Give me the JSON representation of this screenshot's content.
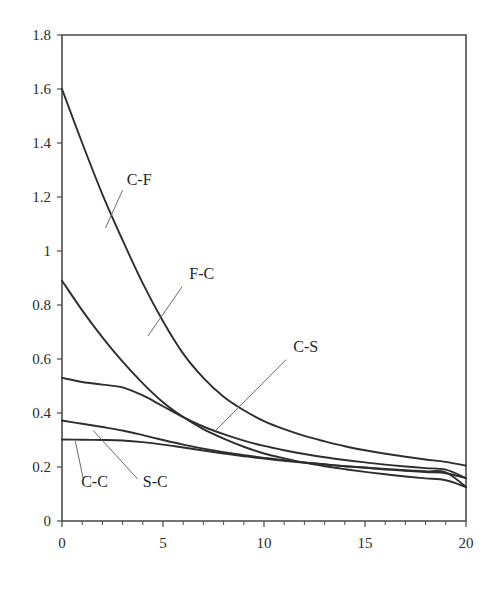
{
  "chart_data": {
    "type": "line",
    "title": "",
    "subtitle": "",
    "xlabel": "",
    "ylabel": "",
    "xlim": [
      0,
      20
    ],
    "ylim": [
      0,
      1.8
    ],
    "grid": false,
    "legend_position": "inline-annotations",
    "x_ticks": [
      0,
      5,
      10,
      15,
      20
    ],
    "x_tick_labels": [
      "0",
      "5",
      "10",
      "15",
      "20"
    ],
    "x_minor_tick_step": 1,
    "y_ticks": [
      0,
      0.2,
      0.4,
      0.6,
      0.8,
      1,
      1.2,
      1.4,
      1.6,
      1.8
    ],
    "y_tick_labels": [
      "0",
      "0.2",
      "0.4",
      "0.6",
      "0.8",
      "1",
      "1.2",
      "1.4",
      "1.6",
      "1.8"
    ],
    "x": [
      0,
      1,
      2,
      3,
      4,
      5,
      6,
      7,
      8,
      9,
      10,
      11,
      12,
      13,
      14,
      15,
      16,
      17,
      18,
      19,
      20
    ],
    "series": [
      {
        "name": "C-F",
        "label": "C-F",
        "color": "#2e2e2e",
        "values": [
          1.6,
          1.4,
          1.21,
          1.04,
          0.88,
          0.74,
          0.62,
          0.53,
          0.46,
          0.41,
          0.37,
          0.34,
          0.315,
          0.295,
          0.277,
          0.262,
          0.249,
          0.238,
          0.228,
          0.219,
          0.205
        ],
        "label_pos": {
          "x": 3.2,
          "y": 1.245
        },
        "leader_from": {
          "x": 2.15,
          "y": 1.085
        },
        "leader_to": {
          "x": 3.0,
          "y": 1.225
        }
      },
      {
        "name": "F-C",
        "label": "F-C",
        "color": "#2e2e2e",
        "values": [
          0.89,
          0.78,
          0.68,
          0.59,
          0.51,
          0.44,
          0.385,
          0.34,
          0.305,
          0.275,
          0.25,
          0.232,
          0.216,
          0.203,
          0.192,
          0.182,
          0.173,
          0.165,
          0.158,
          0.151,
          0.126
        ],
        "label_pos": {
          "x": 6.3,
          "y": 0.895
        },
        "leader_from": {
          "x": 4.25,
          "y": 0.685
        },
        "leader_to": {
          "x": 5.95,
          "y": 0.868
        }
      },
      {
        "name": "C-S",
        "label": "C-S",
        "color": "#2e2e2e",
        "values": [
          0.53,
          0.515,
          0.505,
          0.495,
          0.465,
          0.425,
          0.385,
          0.35,
          0.322,
          0.298,
          0.278,
          0.262,
          0.248,
          0.236,
          0.226,
          0.217,
          0.209,
          0.202,
          0.196,
          0.19,
          0.159
        ],
        "label_pos": {
          "x": 11.45,
          "y": 0.625
        },
        "leader_from": {
          "x": 7.6,
          "y": 0.335
        },
        "leader_to": {
          "x": 11.1,
          "y": 0.598
        }
      },
      {
        "name": "S-C",
        "label": "S-C",
        "color": "#2e2e2e",
        "values": [
          0.372,
          0.36,
          0.348,
          0.335,
          0.318,
          0.3,
          0.283,
          0.268,
          0.255,
          0.244,
          0.234,
          0.225,
          0.217,
          0.21,
          0.203,
          0.197,
          0.191,
          0.186,
          0.181,
          0.177,
          0.159
        ],
        "label_pos": {
          "x": 4.0,
          "y": 0.125
        },
        "leader_from": {
          "x": 1.55,
          "y": 0.335
        },
        "leader_to": {
          "x": 3.75,
          "y": 0.155
        }
      },
      {
        "name": "C-C",
        "label": "C-C",
        "color": "#2e2e2e",
        "values": [
          0.302,
          0.301,
          0.3,
          0.298,
          0.292,
          0.283,
          0.272,
          0.261,
          0.25,
          0.24,
          0.231,
          0.223,
          0.216,
          0.209,
          0.203,
          0.198,
          0.193,
          0.188,
          0.184,
          0.18,
          0.126
        ],
        "label_pos": {
          "x": 0.95,
          "y": 0.125
        },
        "leader_from": {
          "x": 0.65,
          "y": 0.298
        },
        "leader_to": {
          "x": 1.05,
          "y": 0.158
        }
      }
    ]
  },
  "plot_geometry": {
    "left": 62,
    "right": 466,
    "top": 35,
    "bottom": 521
  }
}
